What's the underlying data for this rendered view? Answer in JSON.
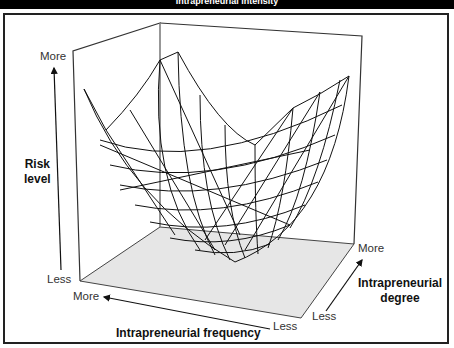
{
  "header": {
    "title": "Intrapreneurial intensity"
  },
  "colors": {
    "frame": "#222222",
    "floor": "#e6e6e6",
    "mesh": "#111111",
    "title_bg": "#000000"
  },
  "axes": {
    "z": {
      "label_line1": "Risk",
      "label_line2": "level",
      "top": "More",
      "bottom": "Less"
    },
    "x": {
      "label": "Intrapreneurial frequency",
      "left": "More",
      "right": "Less"
    },
    "y": {
      "label_line1": "Intrapreneurial",
      "label_line2": "degree",
      "bottom": "Less",
      "top": "More"
    }
  },
  "surface": {
    "type": "wireframe-paraboloid",
    "description": "U-shaped risk surface: minimum at moderate frequency and degree"
  }
}
